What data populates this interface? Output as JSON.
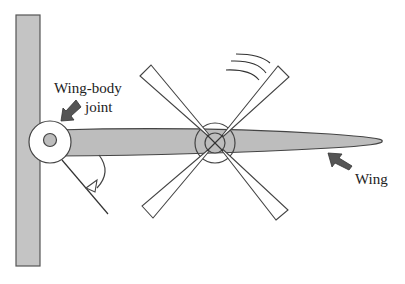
{
  "diagram": {
    "type": "wing-body joint schematic",
    "labels": {
      "joint_line1": "Wing-body",
      "joint_line2": "joint",
      "wing": "Wing"
    },
    "components": [
      "body",
      "wing-body-joint",
      "wing",
      "rotor-blades",
      "motion-arcs",
      "angle-arrow"
    ],
    "colors": {
      "body_fill": "#c4c4c4",
      "wing_fill": "#bdbdbd",
      "outline": "#444444",
      "arrow_fill": "#555555",
      "background": "#ffffff"
    }
  }
}
